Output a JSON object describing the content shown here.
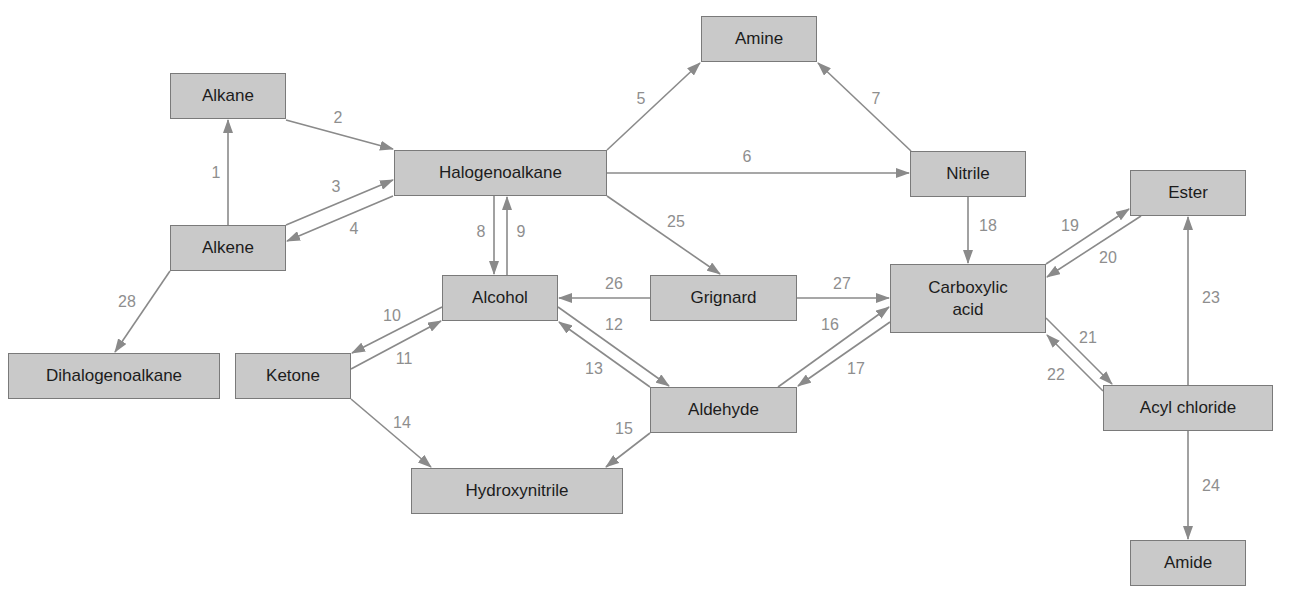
{
  "diagram": {
    "colors": {
      "box_fill": "#c9c9c9",
      "box_border": "#7a7a7a",
      "arrow": "#8a8a8a",
      "label": "#8e8e8e",
      "text": "#1c1c1c"
    },
    "nodes": [
      {
        "id": "alkane",
        "label": "Alkane",
        "x": 170,
        "y": 73,
        "w": 116,
        "h": 46
      },
      {
        "id": "alkene",
        "label": "Alkene",
        "x": 170,
        "y": 225,
        "w": 116,
        "h": 46
      },
      {
        "id": "halogenoalkane",
        "label": "Halogenoalkane",
        "x": 394,
        "y": 150,
        "w": 213,
        "h": 46
      },
      {
        "id": "amine",
        "label": "Amine",
        "x": 701,
        "y": 16,
        "w": 116,
        "h": 46
      },
      {
        "id": "nitrile",
        "label": "Nitrile",
        "x": 910,
        "y": 151,
        "w": 116,
        "h": 46
      },
      {
        "id": "ester",
        "label": "Ester",
        "x": 1130,
        "y": 170,
        "w": 116,
        "h": 46
      },
      {
        "id": "alcohol",
        "label": "Alcohol",
        "x": 442,
        "y": 275,
        "w": 116,
        "h": 46
      },
      {
        "id": "grignard",
        "label": "Grignard",
        "x": 650,
        "y": 275,
        "w": 147,
        "h": 46
      },
      {
        "id": "carboxylic-acid",
        "label": "Carboxylic\nacid",
        "x": 890,
        "y": 264,
        "w": 156,
        "h": 69
      },
      {
        "id": "dihalogenoalkane",
        "label": "Dihalogenoalkane",
        "x": 8,
        "y": 353,
        "w": 212,
        "h": 46
      },
      {
        "id": "ketone",
        "label": "Ketone",
        "x": 235,
        "y": 353,
        "w": 116,
        "h": 46
      },
      {
        "id": "aldehyde",
        "label": "Aldehyde",
        "x": 650,
        "y": 387,
        "w": 147,
        "h": 46
      },
      {
        "id": "acyl-chloride",
        "label": "Acyl chloride",
        "x": 1103,
        "y": 385,
        "w": 170,
        "h": 46
      },
      {
        "id": "hydroxynitrile",
        "label": "Hydroxynitrile",
        "x": 411,
        "y": 468,
        "w": 212,
        "h": 46
      },
      {
        "id": "amide",
        "label": "Amide",
        "x": 1130,
        "y": 540,
        "w": 116,
        "h": 46
      }
    ],
    "edges": [
      {
        "n": "1",
        "from": "alkene",
        "to": "alkane",
        "x1": 228,
        "y1": 225,
        "x2": 228,
        "y2": 120,
        "lx": 216,
        "ly": 173
      },
      {
        "n": "2",
        "from": "alkane",
        "to": "halogenoalkane",
        "x1": 286,
        "y1": 120,
        "x2": 393,
        "y2": 149,
        "lx": 338,
        "ly": 118
      },
      {
        "n": "3",
        "from": "alkene",
        "to": "halogenoalkane",
        "x1": 286,
        "y1": 225,
        "x2": 393,
        "y2": 180,
        "lx": 336,
        "ly": 187
      },
      {
        "n": "4",
        "from": "halogenoalkane",
        "to": "alkene",
        "x1": 393,
        "y1": 196,
        "x2": 287,
        "y2": 241,
        "lx": 354,
        "ly": 229
      },
      {
        "n": "5",
        "from": "halogenoalkane",
        "to": "amine",
        "x1": 607,
        "y1": 150,
        "x2": 700,
        "y2": 63,
        "lx": 641,
        "ly": 99
      },
      {
        "n": "6",
        "from": "halogenoalkane",
        "to": "nitrile",
        "x1": 607,
        "y1": 173,
        "x2": 909,
        "y2": 173,
        "lx": 747,
        "ly": 157
      },
      {
        "n": "7",
        "from": "nitrile",
        "to": "amine",
        "x1": 911,
        "y1": 151,
        "x2": 818,
        "y2": 63,
        "lx": 876,
        "ly": 99
      },
      {
        "n": "8",
        "from": "halogenoalkane",
        "to": "alcohol",
        "x1": 494,
        "y1": 196,
        "x2": 494,
        "y2": 274,
        "lx": 481,
        "ly": 232
      },
      {
        "n": "9",
        "from": "alcohol",
        "to": "halogenoalkane",
        "x1": 507,
        "y1": 275,
        "x2": 507,
        "y2": 197,
        "lx": 521,
        "ly": 232
      },
      {
        "n": "10",
        "from": "alcohol",
        "to": "ketone",
        "x1": 442,
        "y1": 307,
        "x2": 352,
        "y2": 353,
        "lx": 392,
        "ly": 316
      },
      {
        "n": "11",
        "from": "ketone",
        "to": "alcohol",
        "x1": 351,
        "y1": 369,
        "x2": 441,
        "y2": 321,
        "lx": 404,
        "ly": 359
      },
      {
        "n": "12",
        "from": "alcohol",
        "to": "aldehyde",
        "x1": 558,
        "y1": 307,
        "x2": 669,
        "y2": 386,
        "lx": 614,
        "ly": 325
      },
      {
        "n": "13",
        "from": "aldehyde",
        "to": "alcohol",
        "x1": 650,
        "y1": 387,
        "x2": 559,
        "y2": 322,
        "lx": 594,
        "ly": 369
      },
      {
        "n": "14",
        "from": "ketone",
        "to": "hydroxynitrile",
        "x1": 351,
        "y1": 399,
        "x2": 431,
        "y2": 467,
        "lx": 402,
        "ly": 423
      },
      {
        "n": "15",
        "from": "aldehyde",
        "to": "hydroxynitrile",
        "x1": 650,
        "y1": 433,
        "x2": 606,
        "y2": 467,
        "lx": 624,
        "ly": 429
      },
      {
        "n": "16",
        "from": "aldehyde",
        "to": "carboxylic-acid",
        "x1": 778,
        "y1": 387,
        "x2": 889,
        "y2": 307,
        "lx": 830,
        "ly": 325
      },
      {
        "n": "17",
        "from": "carboxylic-acid",
        "to": "aldehyde",
        "x1": 890,
        "y1": 322,
        "x2": 798,
        "y2": 386,
        "lx": 856,
        "ly": 369
      },
      {
        "n": "18",
        "from": "nitrile",
        "to": "carboxylic-acid",
        "x1": 968,
        "y1": 197,
        "x2": 968,
        "y2": 263,
        "lx": 988,
        "ly": 226
      },
      {
        "n": "19",
        "from": "carboxylic-acid",
        "to": "ester",
        "x1": 1046,
        "y1": 264,
        "x2": 1129,
        "y2": 209,
        "lx": 1070,
        "ly": 226
      },
      {
        "n": "20",
        "from": "ester",
        "to": "carboxylic-acid",
        "x1": 1141,
        "y1": 216,
        "x2": 1047,
        "y2": 277,
        "lx": 1108,
        "ly": 258
      },
      {
        "n": "21",
        "from": "carboxylic-acid",
        "to": "acyl-chloride",
        "x1": 1046,
        "y1": 318,
        "x2": 1112,
        "y2": 384,
        "lx": 1088,
        "ly": 338
      },
      {
        "n": "22",
        "from": "acyl-chloride",
        "to": "carboxylic-acid",
        "x1": 1103,
        "y1": 391,
        "x2": 1047,
        "y2": 335,
        "lx": 1056,
        "ly": 375
      },
      {
        "n": "23",
        "from": "acyl-chloride",
        "to": "ester",
        "x1": 1188,
        "y1": 385,
        "x2": 1188,
        "y2": 217,
        "lx": 1211,
        "ly": 298
      },
      {
        "n": "24",
        "from": "acyl-chloride",
        "to": "amide",
        "x1": 1188,
        "y1": 431,
        "x2": 1188,
        "y2": 539,
        "lx": 1211,
        "ly": 486
      },
      {
        "n": "25",
        "from": "halogenoalkane",
        "to": "grignard",
        "x1": 607,
        "y1": 196,
        "x2": 720,
        "y2": 274,
        "lx": 676,
        "ly": 222
      },
      {
        "n": "26",
        "from": "grignard",
        "to": "alcohol",
        "x1": 650,
        "y1": 298,
        "x2": 559,
        "y2": 298,
        "lx": 614,
        "ly": 284
      },
      {
        "n": "27",
        "from": "grignard",
        "to": "carboxylic-acid",
        "x1": 797,
        "y1": 298,
        "x2": 889,
        "y2": 298,
        "lx": 842,
        "ly": 284
      },
      {
        "n": "28",
        "from": "alkene",
        "to": "dihalogenoalkane",
        "x1": 170,
        "y1": 271,
        "x2": 115,
        "y2": 352,
        "lx": 127,
        "ly": 302
      }
    ]
  }
}
